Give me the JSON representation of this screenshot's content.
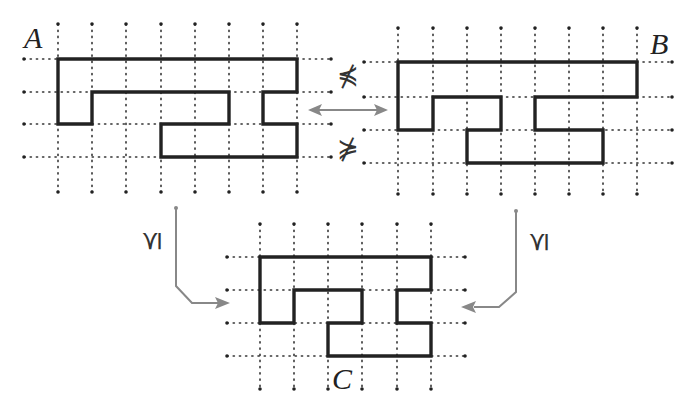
{
  "figure": {
    "labels": {
      "a": "A",
      "b": "B",
      "c": "C"
    },
    "relations": {
      "top_upper": "⋠",
      "top_lower": "⋡",
      "left_to_c": "⪯",
      "right_to_c": "⪯"
    },
    "colors": {
      "shape_stroke": "#222222",
      "grid_dots": "#333333",
      "arrow": "#888888",
      "background": "#ffffff"
    },
    "grids": {
      "A": {
        "cols": 8,
        "rows": 4,
        "shape_cells_desc": "polyomino outline A"
      },
      "B": {
        "cols": 8,
        "rows": 4,
        "shape_cells_desc": "polyomino outline B"
      },
      "C": {
        "cols": 6,
        "rows": 4,
        "shape_cells_desc": "polyomino outline C"
      }
    },
    "arrows": [
      {
        "from": "A",
        "to": "B",
        "type": "double-headed"
      },
      {
        "from": "A",
        "to": "C",
        "type": "single"
      },
      {
        "from": "B",
        "to": "C",
        "type": "single"
      }
    ]
  }
}
